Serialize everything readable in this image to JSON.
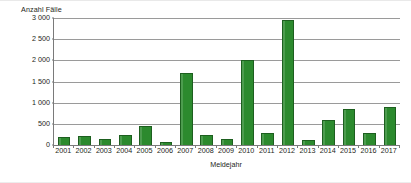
{
  "chart_data": {
    "type": "bar",
    "title": "",
    "subtitle": "",
    "xlabel": "Meldejahr",
    "ylabel": "Anzahl Fälle",
    "categories": [
      "2001",
      "2002",
      "2003",
      "2004",
      "2005",
      "2006",
      "2007",
      "2008",
      "2009",
      "2010",
      "2011",
      "2012",
      "2013",
      "2014",
      "2015",
      "2016",
      "2017"
    ],
    "values": [
      180,
      220,
      140,
      225,
      450,
      70,
      1700,
      230,
      140,
      2000,
      290,
      2950,
      110,
      600,
      850,
      290,
      900
    ],
    "series": [
      {
        "name": "Anzahl Fälle",
        "values": [
          180,
          220,
          140,
          225,
          450,
          70,
          1700,
          230,
          140,
          2000,
          290,
          2950,
          110,
          600,
          850,
          290,
          900
        ]
      }
    ],
    "ylim": [
      0,
      3000
    ],
    "yticks": [
      0,
      500,
      1000,
      1500,
      2000,
      2500,
      3000
    ],
    "ytick_labels": [
      "0",
      "500",
      "1 000",
      "1 500",
      "2 000",
      "2 500",
      "3 000"
    ],
    "grid": true,
    "grid_axis": "y",
    "legend": false,
    "legend_position": "none",
    "bar_color": "#2c8a2e",
    "bar_edge_color": "#1d5f1f",
    "axis_color": "#7a7a7a",
    "grid_color": "#9a9a9a",
    "background_color": "#ffffff"
  }
}
